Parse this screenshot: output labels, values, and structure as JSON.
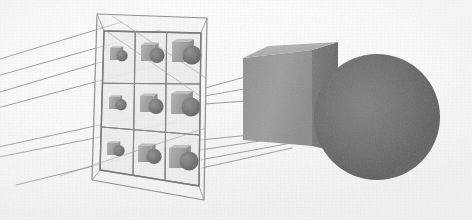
{
  "figure": {
    "title": "Perspective projection of a scene onto a 3 x 3 image plane grid",
    "caption": "",
    "width": 472,
    "height": 220,
    "background_color": "#fdfdfd",
    "ink_color": "#7c7c7c",
    "medium": "scanned grayscale line drawing"
  },
  "palette": {
    "background": "#fdfdfd",
    "paper_tint": "#f2f2f0",
    "line": "#8a8a8a",
    "line_dark": "#6f6f6f",
    "ray": "#9a9a9a",
    "cube_front": "#9a9a9a",
    "cube_right": "#6e6e6e",
    "cube_top": "#b4b4b4",
    "sphere_dark": "#5d5d5d",
    "sphere_light": "#7c7c7c",
    "cell_fill": "#f0f0ee",
    "mini_cube": "#a6a6a6",
    "mini_sphere": "#6b6b6b"
  },
  "scene": {
    "name": "cube-and-sphere-scene",
    "objects": [
      {
        "name": "cube",
        "shape": "cube",
        "label": "",
        "position": {
          "x": 292,
          "y": 98
        },
        "size": {
          "width": 92,
          "height": 88
        },
        "faces": [
          {
            "name": "front",
            "color": "#9a9a9a"
          },
          {
            "name": "right",
            "color": "#6e6e6e"
          },
          {
            "name": "top",
            "color": "#b4b4b4"
          }
        ]
      },
      {
        "name": "sphere",
        "shape": "sphere",
        "label": "",
        "position": {
          "x": 377,
          "y": 117
        },
        "radius": 63,
        "color": "#5d5d5d",
        "highlight": "#7e7e7e"
      }
    ]
  },
  "image_plane": {
    "name": "image-plane-grid",
    "label": "",
    "rows": 3,
    "columns": 3,
    "cell_count": 9,
    "outer_frame": true,
    "cells": [
      {
        "row": 1,
        "col": 1,
        "content": "mini-cube-and-sphere",
        "scale": "small"
      },
      {
        "row": 1,
        "col": 2,
        "content": "mini-cube-and-sphere",
        "scale": "medium"
      },
      {
        "row": 1,
        "col": 3,
        "content": "mini-cube-and-sphere",
        "scale": "large"
      },
      {
        "row": 2,
        "col": 1,
        "content": "mini-cube-and-sphere",
        "scale": "small"
      },
      {
        "row": 2,
        "col": 2,
        "content": "mini-cube-and-sphere",
        "scale": "medium"
      },
      {
        "row": 2,
        "col": 3,
        "content": "mini-cube-and-sphere",
        "scale": "large"
      },
      {
        "row": 3,
        "col": 1,
        "content": "mini-cube-and-sphere",
        "scale": "small"
      },
      {
        "row": 3,
        "col": 2,
        "content": "mini-cube-and-sphere",
        "scale": "medium"
      },
      {
        "row": 3,
        "col": 3,
        "content": "mini-cube-and-sphere",
        "scale": "large"
      }
    ]
  },
  "projection_rays": {
    "name": "projection-rays",
    "left_bundle_count": 5,
    "right_bundle_count": 6,
    "description": "Straight lines radiating from the scene through the image plane toward the viewpoint at the left",
    "color": "#9a9a9a"
  },
  "annotations": []
}
